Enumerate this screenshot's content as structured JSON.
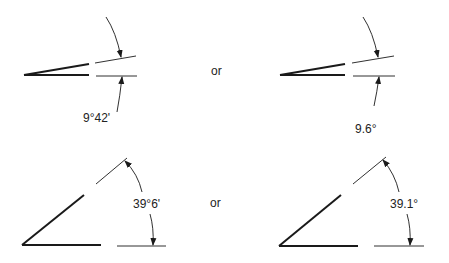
{
  "figures": [
    {
      "id": "small-angle-dms",
      "label": "9°42'",
      "format": "degrees-minutes"
    },
    {
      "id": "small-angle-decimal",
      "label": "9.6°",
      "format": "decimal-degrees"
    },
    {
      "id": "large-angle-dms",
      "label": "39°6'",
      "format": "degrees-minutes"
    },
    {
      "id": "large-angle-decimal",
      "label": "39.1°",
      "format": "decimal-degrees"
    }
  ],
  "separators": {
    "top": "or",
    "bottom": "or"
  },
  "colors": {
    "line": "#1a1a1a",
    "background": "#ffffff"
  }
}
